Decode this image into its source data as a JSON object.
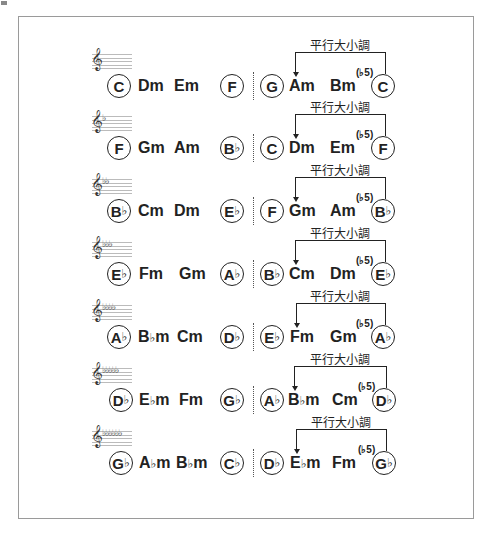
{
  "bracket_label": "平行大小調",
  "flat": "♭",
  "superscript": "(♭5)",
  "rows": [
    {
      "key_flats": "",
      "chords": [
        "C",
        "Dm",
        "Em",
        "F",
        "G",
        "Am",
        "Bm",
        "C"
      ]
    },
    {
      "key_flats": "♭",
      "chords": [
        "F",
        "Gm",
        "Am",
        "B♭",
        "C",
        "Dm",
        "Em",
        "F"
      ]
    },
    {
      "key_flats": "♭♭",
      "chords": [
        "B♭",
        "Cm",
        "Dm",
        "E♭",
        "F",
        "Gm",
        "Am",
        "B♭"
      ]
    },
    {
      "key_flats": "♭♭♭",
      "chords": [
        "E♭",
        "Fm",
        "Gm",
        "A♭",
        "B♭",
        "Cm",
        "Dm",
        "E♭"
      ]
    },
    {
      "key_flats": "♭♭♭♭",
      "chords": [
        "A♭",
        "B♭m",
        "Cm",
        "D♭",
        "E♭",
        "Fm",
        "Gm",
        "A♭"
      ]
    },
    {
      "key_flats": "♭♭♭♭♭",
      "chords": [
        "D♭",
        "E♭m",
        "Fm",
        "G♭",
        "A♭",
        "B♭m",
        "Cm",
        "D♭"
      ]
    },
    {
      "key_flats": "♭♭♭♭♭♭",
      "chords": [
        "G♭",
        "A♭m",
        "B♭m",
        "C♭",
        "D♭",
        "E♭m",
        "Fm",
        "G♭"
      ]
    }
  ]
}
